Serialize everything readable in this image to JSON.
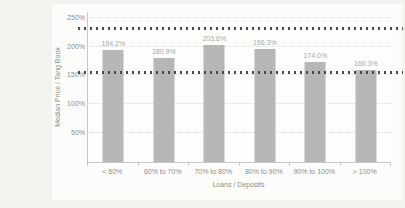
{
  "chart_data": {
    "type": "bar",
    "categories": [
      "< 60%",
      "60% to 70%",
      "70% to 80%",
      "80% to 90%",
      "90% to 100%",
      "> 100%"
    ],
    "values": [
      194.2,
      180.9,
      203.6,
      196.3,
      174.0,
      160.3
    ],
    "value_labels": [
      "194.2%",
      "180.9%",
      "203.6%",
      "196.3%",
      "174.0%",
      "160.3%"
    ],
    "title": "",
    "xlabel": "Loans / Deposits",
    "ylabel": "Median Price / Tang Book",
    "ylim": [
      0,
      260
    ],
    "y_gridlines": [
      {
        "value": 50,
        "label": "50%"
      },
      {
        "value": 100,
        "label": "100%"
      },
      {
        "value": 150,
        "label": "150%"
      },
      {
        "value": 200,
        "label": "200%"
      },
      {
        "value": 250,
        "label": "250%"
      }
    ],
    "reference_lines": [
      {
        "value": 228,
        "style": "bold-dotted"
      },
      {
        "value": 153,
        "style": "bold-dotted"
      }
    ],
    "grid": "horizontal-dotted",
    "legend": "none"
  },
  "colors": {
    "page_bg": "#f3f3f0",
    "plot_bg": "#fdfdfc",
    "bar": "#b6b8b7",
    "bar_label": "#a5a7a6",
    "axis_text": "#8c8c8c",
    "gridline": "#dcdcda",
    "reference_line": "#4a4a4a",
    "axis_line": "#c8c8c6"
  }
}
